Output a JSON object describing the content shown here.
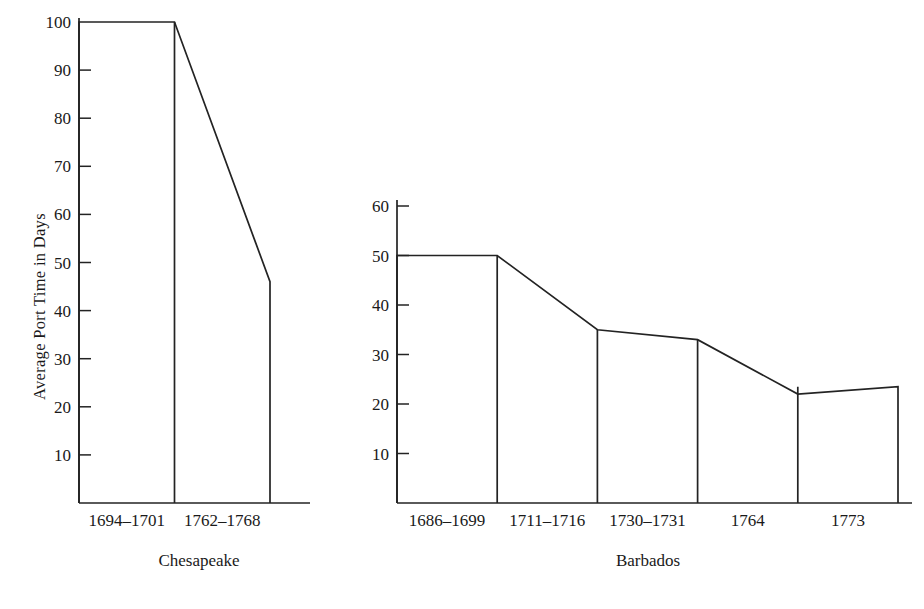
{
  "figure": {
    "background_color": "#ffffff",
    "line_color": "#232323",
    "text_color": "#1a1a1a",
    "ylabel": "Average Port Time in Days"
  },
  "panels": [
    {
      "caption": "Chesapeake",
      "y_ticks": [
        "10",
        "20",
        "30",
        "40",
        "50",
        "60",
        "70",
        "80",
        "90",
        "100"
      ],
      "categories": [
        "1694–1701",
        "1762–1768"
      ],
      "values": [
        100,
        46
      ]
    },
    {
      "caption": "Barbados",
      "y_ticks": [
        "10",
        "20",
        "30",
        "40",
        "50",
        "60"
      ],
      "categories": [
        "1686–1699",
        "1711–1716",
        "1730–1731",
        "1764",
        "1773"
      ],
      "values": [
        50,
        35,
        33,
        22,
        23.5
      ]
    }
  ],
  "chart_data": {
    "type": "bar",
    "title": "",
    "subtitle": "",
    "xlabel": "",
    "ylabel": "Average Port Time in Days",
    "grid": false,
    "legend": "none",
    "panels": [
      {
        "name": "Chesapeake",
        "categories": [
          "1694–1701",
          "1762–1768"
        ],
        "values": [
          100,
          46
        ],
        "ylim": [
          0,
          104
        ],
        "yticks": [
          10,
          20,
          30,
          40,
          50,
          60,
          70,
          80,
          90,
          100
        ],
        "ytick_labels": [
          "10",
          "20",
          "30",
          "40",
          "50",
          "60",
          "70",
          "80",
          "90",
          "100"
        ]
      },
      {
        "name": "Barbados",
        "categories": [
          "1686–1699",
          "1711–1716",
          "1730–1731",
          "1764",
          "1773"
        ],
        "values": [
          50,
          35,
          33,
          22,
          23.5
        ],
        "ylim": [
          0,
          62
        ],
        "yticks": [
          10,
          20,
          30,
          40,
          50,
          60
        ],
        "ytick_labels": [
          "10",
          "20",
          "30",
          "40",
          "50",
          "60"
        ]
      }
    ]
  }
}
